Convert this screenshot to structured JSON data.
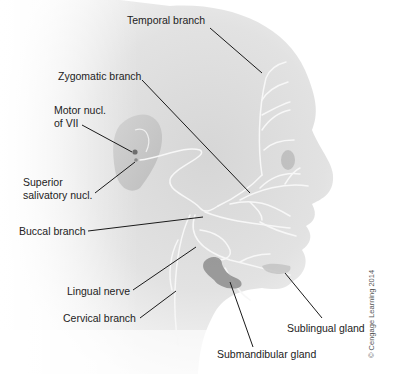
{
  "figure": {
    "copyright": "© Cengage Learning 2014"
  },
  "labels": {
    "temporal": "Temporal branch",
    "zygomatic": "Zygomatic branch",
    "motor_nucl_line1": "Motor nucl.",
    "motor_nucl_line2": "of VII",
    "sup_sal_line1": "Superior",
    "sup_sal_line2": "salivatory nucl.",
    "buccal": "Buccal branch",
    "lingual": "Lingual nerve",
    "cervical": "Cervical branch",
    "sublingual": "Sublingual gland",
    "submandibular": "Submandibular gland"
  },
  "colors": {
    "skin_light": "#efefef",
    "skin_dark": "#bdbdbd",
    "nerve": "#f7f7f7",
    "gland": "#7a7a7a",
    "leader": "#1a1a1a",
    "text": "#222222"
  }
}
